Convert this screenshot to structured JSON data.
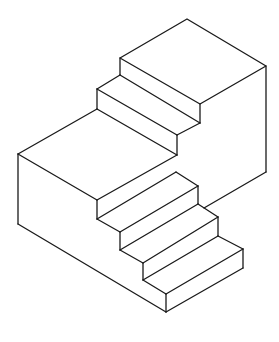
{
  "figure": {
    "title": "",
    "stroke_color": "#1a1a1a",
    "background": "#ffffff",
    "parts": {
      "upper_block": "upper-landing",
      "upper_steps": 2,
      "middle_landing": "middle-landing",
      "lower_steps": 4
    }
  }
}
